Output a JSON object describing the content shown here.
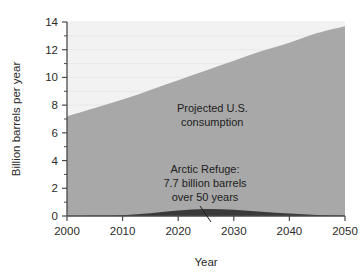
{
  "chart_data": {
    "type": "area",
    "title": "",
    "xlabel": "Year",
    "ylabel": "Billion barrels per year",
    "xlim": [
      2000,
      2050
    ],
    "ylim": [
      0,
      14
    ],
    "grid": true,
    "grid_note": "faint horizontal gridlines every 1 unit in the light upper region",
    "legend": "none (in-plot annotations)",
    "x_ticks": [
      2000,
      2010,
      2020,
      2030,
      2040,
      2050
    ],
    "y_ticks": [
      0,
      2,
      4,
      6,
      8,
      10,
      12,
      14
    ],
    "y_minor_ticks": [
      1,
      3,
      5,
      7,
      9,
      11,
      13
    ],
    "x": [
      2000,
      2005,
      2010,
      2015,
      2020,
      2025,
      2030,
      2035,
      2040,
      2045,
      2050
    ],
    "series": [
      {
        "name": "Projected U.S. consumption",
        "color": "#a8a8a8",
        "values": [
          7.2,
          7.8,
          8.4,
          9.1,
          9.8,
          10.5,
          11.2,
          11.9,
          12.5,
          13.2,
          13.7
        ]
      },
      {
        "name": "Arctic Refuge",
        "color": "#3a3a3a",
        "values": [
          0.0,
          0.02,
          0.06,
          0.2,
          0.4,
          0.5,
          0.45,
          0.3,
          0.18,
          0.08,
          0.02
        ]
      }
    ],
    "annotations": [
      {
        "name": "projected-consumption-label",
        "lines": [
          "Projected U.S.",
          "consumption"
        ],
        "x": 2026,
        "y": 8.2
      },
      {
        "name": "arctic-refuge-label",
        "lines": [
          "Arctic Refuge:",
          "7.7 billion barrels",
          "over 50 years"
        ],
        "x": 2025,
        "y": 4.0,
        "leader_line": true
      }
    ]
  },
  "axes": {
    "y_title": "Billion barrels per year",
    "x_title": "Year",
    "y_tick_labels": [
      "14",
      "12",
      "10",
      "8",
      "6",
      "4",
      "2",
      "0"
    ],
    "x_tick_labels": [
      "2000",
      "2010",
      "2020",
      "2030",
      "2040",
      "2050"
    ]
  },
  "annotations": {
    "consumption": {
      "line1": "Projected U.S.",
      "line2": "consumption"
    },
    "refuge": {
      "line1": "Arctic Refuge:",
      "line2": "7.7 billion barrels",
      "line3": "over 50 years"
    }
  },
  "colors": {
    "background": "#ffffff",
    "upper_area": "#f2f2f2",
    "consumption_area": "#a8a8a8",
    "refuge_area": "#3a3a3a",
    "axis": "#4a4a4a",
    "gridline": "#e6e6e6",
    "text": "#2b2b2b"
  }
}
